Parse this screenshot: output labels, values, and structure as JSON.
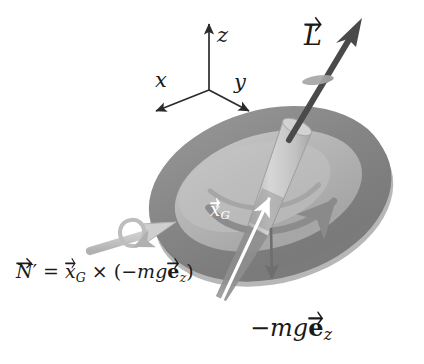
{
  "figure": {
    "background_color": "#ffffff",
    "width": 424,
    "height": 364
  },
  "axes": {
    "origin": [
      209,
      90
    ],
    "items": [
      {
        "name": "z",
        "label": "z",
        "tip": [
          209,
          20
        ],
        "label_pos": [
          218,
          30
        ]
      },
      {
        "name": "x",
        "label": "x",
        "tip": [
          152,
          114
        ],
        "label_pos": [
          157,
          72
        ]
      },
      {
        "name": "y",
        "label": "y",
        "tip": [
          253,
          114
        ],
        "label_pos": [
          236,
          74
        ]
      }
    ],
    "color": "#2b2b2b"
  },
  "vectors": [
    {
      "name": "angular-momentum",
      "label_main": "L",
      "label_has_arrow": true,
      "label_pos": [
        306,
        22
      ],
      "tail": [
        288,
        140
      ],
      "tip": [
        360,
        22
      ],
      "color": "#4a4a4a",
      "description": "angular momentum vector along spin axis"
    },
    {
      "name": "center-of-mass-position",
      "label_main": "x",
      "label_sub": "G",
      "label_has_arrow": true,
      "label_pos": [
        212,
        204
      ],
      "tail": [
        222,
        300
      ],
      "tip": [
        274,
        193
      ],
      "color": "#ffffff",
      "description": "position vector of center of gravity"
    },
    {
      "name": "torque",
      "label_main": "N",
      "label_prime": true,
      "label_has_arrow": true,
      "tail": [
        92,
        250
      ],
      "tip": [
        168,
        226
      ],
      "color": "#c9c9c9",
      "description": "torque vector with rotation loop"
    },
    {
      "name": "weight",
      "label_main": "-mge_z",
      "tail": [
        271,
        228
      ],
      "tip": [
        273,
        285
      ],
      "color": "#6e6e6e",
      "description": "gravitational force arrow pointing down"
    }
  ],
  "equations": {
    "torque_equation": {
      "name": "torque-equation",
      "pos": [
        16,
        262
      ],
      "font_size": 19,
      "parts": {
        "lhs_symbol": "N",
        "prime": "′",
        "equals": "=",
        "xg_symbol": "x",
        "xg_sub": "G",
        "cross": "×",
        "open_paren": "(",
        "minus_mg": "−mg",
        "e_symbol": "e",
        "e_sub": "z",
        "close_paren": ")"
      },
      "plain_text": "N′ = x_G × (−mg e_z)"
    },
    "weight_label": {
      "name": "weight-label",
      "pos": [
        250,
        318
      ],
      "font_size": 24,
      "parts": {
        "minus_mg": "−mg",
        "e_symbol": "e",
        "e_sub": "z"
      },
      "plain_text": "−mg e_z"
    }
  },
  "disk": {
    "name": "flywheel-disk",
    "center": [
      272,
      196
    ],
    "rim_color": "#8c8c8c",
    "face_color": "#b4b4b4",
    "highlight_color": "#c4c4c4",
    "shadow_color": "#7e7e7e",
    "rotation_deg": -16,
    "rx": 122,
    "ry": 82,
    "spin_arc": "curved arrow on disk face indicating spin sense"
  },
  "axle": {
    "name": "spin-axle",
    "color": "#c9c9c9",
    "edge_color": "#a8a8a8",
    "top": [
      300,
      118
    ],
    "bottom": [
      222,
      300
    ]
  },
  "spin_ring": {
    "name": "spin-ring-on-axis",
    "pos": [
      318,
      80
    ],
    "color": "#9a9a9a"
  },
  "colors": {
    "ink": "#1a1a1a",
    "rim": "#8c8c8c",
    "face": "#b4b4b4",
    "axle": "#c9c9c9",
    "L_arrow": "#4a4a4a",
    "torque_arrow": "#c9c9c9",
    "white": "#ffffff"
  }
}
